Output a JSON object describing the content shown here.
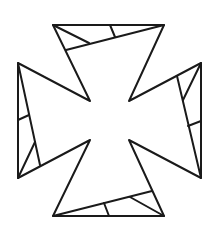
{
  "figure": {
    "width": 224,
    "height": 234,
    "background": "#ffffff",
    "stroke_color": "#1a1a1a",
    "stroke_width": 2,
    "outline": [
      [
        53,
        25
      ],
      [
        164,
        25
      ],
      [
        129,
        101
      ],
      [
        201,
        63
      ],
      [
        201,
        178
      ],
      [
        129,
        140
      ],
      [
        164,
        216
      ],
      [
        53,
        216
      ],
      [
        90,
        140
      ],
      [
        18,
        178
      ],
      [
        18,
        63
      ],
      [
        90,
        101
      ]
    ],
    "dissection_lines": [
      {
        "name": "top-inner-line",
        "from": [
          66,
          50
        ],
        "to": [
          164,
          25
        ]
      },
      {
        "name": "top-short-line",
        "from": [
          53,
          25
        ],
        "to": [
          89,
          43
        ]
      },
      {
        "name": "top-tick-line",
        "from": [
          110,
          25
        ],
        "to": [
          115,
          37
        ]
      },
      {
        "name": "left-inner-line",
        "from": [
          18,
          63
        ],
        "to": [
          40,
          165
        ]
      },
      {
        "name": "left-tick-line",
        "from": [
          18,
          120
        ],
        "to": [
          29,
          115
        ]
      },
      {
        "name": "left-short-line",
        "from": [
          18,
          178
        ],
        "to": [
          35,
          142
        ]
      },
      {
        "name": "right-inner-line",
        "from": [
          177,
          76
        ],
        "to": [
          201,
          178
        ]
      },
      {
        "name": "right-short-line",
        "from": [
          201,
          63
        ],
        "to": [
          183,
          100
        ]
      },
      {
        "name": "right-tick-line",
        "from": [
          188,
          126
        ],
        "to": [
          201,
          121
        ]
      },
      {
        "name": "bottom-inner-line",
        "from": [
          53,
          216
        ],
        "to": [
          152,
          191
        ]
      },
      {
        "name": "bottom-short-line",
        "from": [
          164,
          216
        ],
        "to": [
          130,
          197
        ]
      },
      {
        "name": "bottom-tick-line",
        "from": [
          104,
          203
        ],
        "to": [
          109,
          216
        ]
      }
    ]
  }
}
